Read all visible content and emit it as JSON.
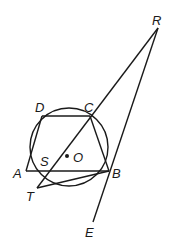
{
  "diagram": {
    "type": "geometry",
    "circle": {
      "center_label": "O",
      "cx": 69,
      "cy": 147,
      "r": 39
    },
    "points": {
      "R": {
        "label": "R",
        "x": 158,
        "y": 28
      },
      "C": {
        "label": "C",
        "x": 90,
        "y": 116
      },
      "D": {
        "label": "D",
        "x": 42,
        "y": 116
      },
      "A": {
        "label": "A",
        "x": 31,
        "y": 171
      },
      "B": {
        "label": "B",
        "x": 109,
        "y": 171
      },
      "S": {
        "label": "S",
        "x": 58,
        "y": 171
      },
      "T": {
        "label": "T",
        "x": 37,
        "y": 188
      },
      "E": {
        "label": "E",
        "x": 93,
        "y": 223
      },
      "O": {
        "label": "O",
        "x": 68,
        "y": 156
      }
    },
    "segments": [
      [
        "D",
        "C"
      ],
      [
        "A",
        "D"
      ],
      [
        "C",
        "B"
      ],
      [
        "A",
        "B"
      ],
      [
        "T",
        "B"
      ],
      [
        "R",
        "T"
      ],
      [
        "R",
        "E"
      ]
    ]
  }
}
